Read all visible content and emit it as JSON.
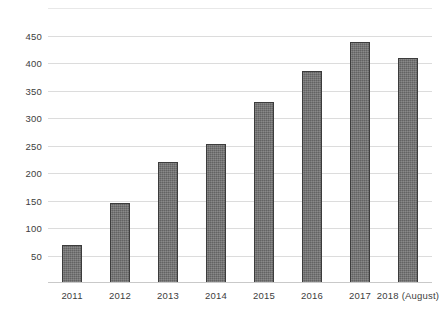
{
  "chart_data": {
    "type": "bar",
    "title": "",
    "subtitle": "",
    "xlabel": "",
    "ylabel": "",
    "categories": [
      "2011",
      "2012",
      "2013",
      "2014",
      "2015",
      "2016",
      "2017",
      "2018 (August)"
    ],
    "values": [
      70,
      145,
      220,
      253,
      330,
      385,
      438,
      410
    ],
    "series": [
      {
        "name": "",
        "values": [
          70,
          145,
          220,
          253,
          330,
          385,
          438,
          410
        ]
      }
    ],
    "ylim": [
      0,
      500
    ],
    "yticks": [
      50,
      100,
      150,
      200,
      250,
      300,
      350,
      400,
      450
    ],
    "ytick_labels": [
      "50",
      "100",
      "150",
      "200",
      "250",
      "300",
      "350",
      "400",
      "450"
    ],
    "grid": true,
    "grid_axis": "y",
    "legend": false,
    "legend_position": "none",
    "bar_color": "#6f6f6f",
    "bar_edge_color": "#3c3c3c",
    "gridline_color": "#dcdcdc",
    "background_color": "#ffffff",
    "text_color": "#3d3d3d",
    "annotations": []
  }
}
